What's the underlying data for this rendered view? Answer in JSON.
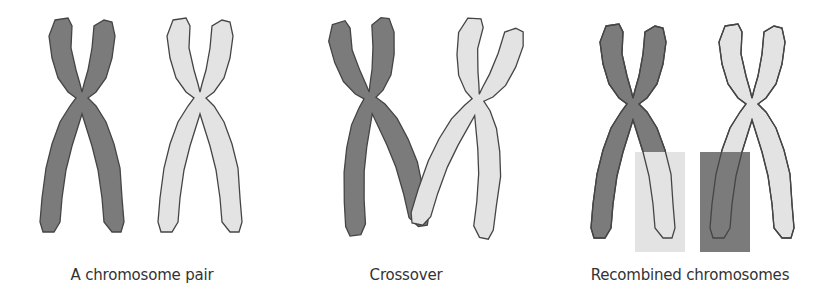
{
  "colors": {
    "dark": "#7b7b7b",
    "light": "#e3e3e3",
    "outline": "#454545"
  },
  "panels": [
    {
      "caption": "A chromosome pair"
    },
    {
      "caption": "Crossover"
    },
    {
      "caption": "Recombined chromosomes"
    }
  ]
}
